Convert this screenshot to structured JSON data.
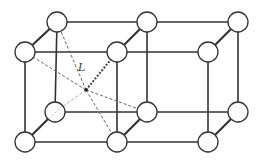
{
  "diagram": {
    "type": "crystal-lattice",
    "label": "L",
    "colors": {
      "background": "#ffffff",
      "line": "#333333",
      "dashed": "#666666",
      "atom_fill": "#ffffff",
      "atom_stroke": "#333333"
    },
    "atom_radius": 10,
    "atoms": [
      {
        "id": "back-top-left",
        "x": 57,
        "y": 22
      },
      {
        "id": "back-top-middle",
        "x": 147,
        "y": 22
      },
      {
        "id": "back-top-right",
        "x": 238,
        "y": 22
      },
      {
        "id": "front-top-left",
        "x": 25,
        "y": 52
      },
      {
        "id": "front-top-middle",
        "x": 117,
        "y": 52
      },
      {
        "id": "front-top-right",
        "x": 208,
        "y": 52
      },
      {
        "id": "back-bottom-left",
        "x": 55,
        "y": 112
      },
      {
        "id": "back-bottom-middle",
        "x": 147,
        "y": 112
      },
      {
        "id": "back-bottom-right",
        "x": 238,
        "y": 112
      },
      {
        "id": "front-bottom-left",
        "x": 25,
        "y": 142
      },
      {
        "id": "front-bottom-middle",
        "x": 117,
        "y": 142
      },
      {
        "id": "front-bottom-right",
        "x": 208,
        "y": 142
      }
    ],
    "center_point": {
      "x": 86,
      "y": 90
    },
    "label_position": {
      "x": 78,
      "y": 71
    }
  }
}
